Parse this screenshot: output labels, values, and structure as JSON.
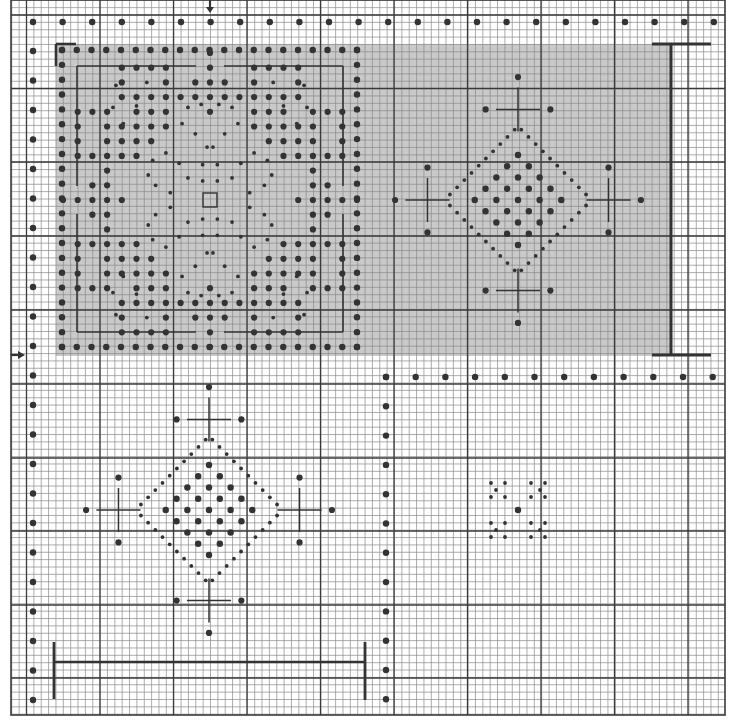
{
  "colors": {
    "background": "#ffffff",
    "minor_grid": "#8a8a8a",
    "major_grid": "#3a3a3a",
    "shade": "#c9c9c9",
    "ink": "#333333"
  },
  "grid": {
    "left": 11,
    "top": 0,
    "right": 725,
    "bottom": 715,
    "cell": 7.36,
    "major_x": [
      26.5,
      100,
      173.5,
      247,
      320.5,
      394,
      467.5,
      541,
      614.5,
      688
    ],
    "major_y": [
      15,
      88.5,
      162,
      236,
      310,
      384,
      458,
      531,
      605,
      678
    ]
  },
  "shaded_region": {
    "x": 56,
    "y": 44,
    "w": 615,
    "h": 312
  },
  "markers": {
    "top_arrow": {
      "x": 210,
      "y": 0,
      "label": "center-column-marker"
    },
    "left_arrow": {
      "x": 11,
      "y": 355,
      "label": "center-row-marker"
    }
  },
  "borders": {
    "top_row_dots": {
      "y": 22,
      "x_start": 33,
      "x_end": 714,
      "step": 29.6
    },
    "left_col_dots": {
      "x": 33,
      "y_start": 51,
      "y_end": 699,
      "step": 29.5
    },
    "lower_right_top_row": {
      "y": 377,
      "x_start": 386,
      "x_end": 713,
      "step": 29.7
    },
    "lower_left_col": {
      "x": 386,
      "y_start": 377,
      "y_end": 699,
      "step": 29.3
    }
  },
  "brackets": [
    {
      "type": "corner",
      "x": 56,
      "y": 44
    },
    {
      "type": "vertical-I",
      "x": 671,
      "y1": 44,
      "y2": 355,
      "w": 60
    },
    {
      "type": "horizontal-I",
      "y": 663,
      "x1": 54,
      "x2": 364,
      "h": 56
    }
  ],
  "motifs": [
    {
      "name": "large-square-motif",
      "cx": 210,
      "cy": 200,
      "frame": {
        "x": 62,
        "y": 50,
        "w": 295,
        "h": 298
      }
    },
    {
      "name": "diamond-motif-upper-right",
      "cx": 518,
      "cy": 200
    },
    {
      "name": "diamond-motif-lower-left",
      "cx": 209,
      "cy": 510
    },
    {
      "name": "small-flower-motif",
      "cx": 518,
      "cy": 510
    }
  ]
}
